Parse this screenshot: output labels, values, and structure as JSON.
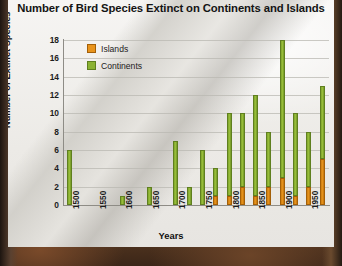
{
  "chart_data": {
    "type": "bar",
    "title": "Number of Bird Species Extinct on Continents and Islands",
    "xlabel": "Years",
    "ylabel": "Number of Extinct Species",
    "ylim": [
      0,
      18
    ],
    "yticks": [
      0,
      2,
      4,
      6,
      8,
      10,
      12,
      14,
      16,
      18
    ],
    "xticks": [
      "1500",
      "1550",
      "1600",
      "1650",
      "1700",
      "1750",
      "1800",
      "1850",
      "1900",
      "1950"
    ],
    "grid": true,
    "stacked": true,
    "legend_position": "top-left",
    "legend": [
      "Islands",
      "Continents"
    ],
    "colors": {
      "islands": "#e8941c",
      "continents": "#8bb233"
    },
    "categories": [
      "1500",
      "1525",
      "1550",
      "1575",
      "1600",
      "1625",
      "1650",
      "1675",
      "1700",
      "1725",
      "1750",
      "1775",
      "1800",
      "1825",
      "1850",
      "1875",
      "1900",
      "1925",
      "1950",
      "1975"
    ],
    "series": [
      {
        "name": "Islands",
        "values": [
          0,
          0,
          0,
          0,
          0,
          0,
          0,
          0,
          0,
          0,
          0,
          1,
          1,
          2,
          1,
          2,
          3,
          1,
          2,
          5
        ]
      },
      {
        "name": "Continents",
        "values": [
          6,
          0,
          0,
          0,
          1,
          0,
          2,
          0,
          7,
          2,
          6,
          3,
          9,
          8,
          11,
          6,
          15,
          9,
          6,
          8
        ]
      }
    ],
    "totals": [
      6,
      0,
      0,
      0,
      1,
      0,
      2,
      0,
      7,
      2,
      6,
      4,
      10,
      10,
      12,
      8,
      18,
      10,
      8,
      13
    ]
  }
}
